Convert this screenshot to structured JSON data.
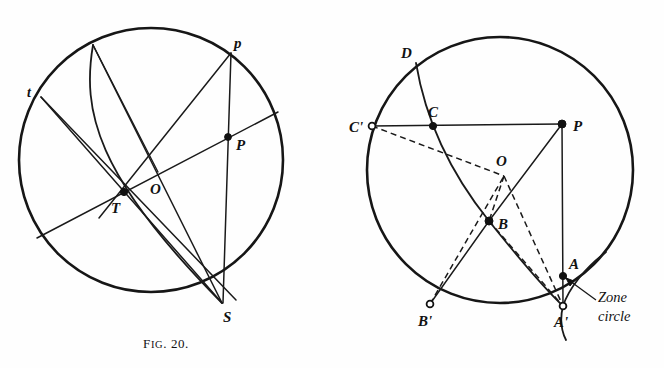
{
  "document": {
    "kind": "textbook-figure-plate",
    "figure_count": 2
  },
  "figures": [
    {
      "id": "fig-20",
      "caption_prefix": "F",
      "caption_smallcaps": "IG",
      "caption_suffix": ". 20.",
      "caption_full": "Fig. 20.",
      "circle": {
        "cx": 151,
        "cy": 160,
        "r": 132
      },
      "points": [
        {
          "name": "t",
          "label": "t",
          "x": 41,
          "y": 97,
          "marker": "none",
          "label_x": 27,
          "label_y": 92
        },
        {
          "name": "p",
          "label": "p",
          "x": 231,
          "y": 53,
          "marker": "none",
          "label_x": 236,
          "label_y": 42
        },
        {
          "name": "P",
          "label": "P",
          "x": 228,
          "y": 137,
          "marker": "filled",
          "label_x": 236,
          "label_y": 147
        },
        {
          "name": "O",
          "label": "O",
          "x": 158,
          "y": 172,
          "marker": "none",
          "label_x": 151,
          "label_y": 192
        },
        {
          "name": "T",
          "label": "T",
          "x": 124,
          "y": 192,
          "marker": "filled",
          "label_x": 113,
          "label_y": 212
        },
        {
          "name": "S",
          "label": "S",
          "x": 222,
          "y": 303,
          "marker": "none",
          "label_x": 224,
          "label_y": 321
        }
      ],
      "chords": [
        {
          "name": "chord-t-S",
          "from": "t",
          "to": "S"
        },
        {
          "name": "chord-t-O-P",
          "from": "t",
          "to": "P-ext"
        },
        {
          "name": "chord-p-S",
          "from": "p",
          "to": "S"
        },
        {
          "name": "chord-p-O-T",
          "from": "p",
          "to": "T-ext"
        },
        {
          "name": "chord-top-O-S",
          "from": "top-arc",
          "to": "S"
        },
        {
          "name": "chord-P-ray",
          "from": "O",
          "to": "P-rim"
        }
      ],
      "arcs": [
        {
          "name": "arc-top-to-S",
          "desc": "curved arc from upper rim through T to S"
        }
      ]
    },
    {
      "id": "fig-21",
      "caption_prefix": "F",
      "caption_smallcaps": "IG",
      "caption_suffix": ". 21.",
      "caption_full": "Fig. 21.",
      "circle": {
        "cx": 500,
        "cy": 170,
        "r": 133
      },
      "points": [
        {
          "name": "D",
          "label": "D",
          "x": 416,
          "y": 63,
          "marker": "none",
          "label_x": 402,
          "label_y": 54
        },
        {
          "name": "C",
          "label": "C",
          "x": 433,
          "y": 126,
          "marker": "filled",
          "label_x": 428,
          "label_y": 116
        },
        {
          "name": "C'",
          "label": "C'",
          "x": 372,
          "y": 126,
          "marker": "open",
          "label_x": 351,
          "label_y": 131
        },
        {
          "name": "P",
          "label": "P",
          "x": 562,
          "y": 124,
          "marker": "filled",
          "label_x": 572,
          "label_y": 130
        },
        {
          "name": "O",
          "label": "O",
          "x": 502,
          "y": 172,
          "marker": "none",
          "label_x": 497,
          "label_y": 165
        },
        {
          "name": "B",
          "label": "B",
          "x": 489,
          "y": 221,
          "marker": "filled",
          "label_x": 498,
          "label_y": 228
        },
        {
          "name": "B'",
          "label": "B'",
          "x": 430,
          "y": 304,
          "marker": "open",
          "label_x": 420,
          "label_y": 325
        },
        {
          "name": "A",
          "label": "A",
          "x": 563,
          "y": 276,
          "marker": "filled",
          "label_x": 569,
          "label_y": 268
        },
        {
          "name": "A'",
          "label": "A'",
          "x": 563,
          "y": 306,
          "marker": "open",
          "label_x": 556,
          "label_y": 326
        }
      ],
      "annotation": {
        "name": "zone-circle-callout",
        "line1": "Zone",
        "line2": "circle",
        "line1_x": 598,
        "line1_y": 302,
        "line2_x": 598,
        "line2_y": 321
      },
      "solid_segments": [
        {
          "name": "seg-Cprime-C-P",
          "from": "C'",
          "to": "P"
        },
        {
          "name": "seg-P-Aprime",
          "from": "P",
          "to": "A'"
        },
        {
          "name": "seg-P-B",
          "from": "P",
          "to": "B"
        },
        {
          "name": "seg-B-Bprime",
          "from": "B",
          "to": "B'"
        }
      ],
      "dashed_segments": [
        {
          "name": "dash-Cprime-O",
          "from": "C'",
          "to": "O"
        },
        {
          "name": "dash-O-B",
          "from": "O",
          "to": "B"
        },
        {
          "name": "dash-O-Aprime",
          "from": "O",
          "to": "A'"
        },
        {
          "name": "dash-B-Aprime",
          "from": "B",
          "to": "A'"
        },
        {
          "name": "dash-Bprime-O",
          "from": "B'",
          "to": "O"
        }
      ],
      "arcs": [
        {
          "name": "arc-D-C-B-Aprime",
          "desc": "great-circle arc from D through C and B down to A'"
        },
        {
          "name": "arc-zone-circle",
          "desc": "small zone circle arc passing near A and A'"
        }
      ]
    }
  ],
  "colors": {
    "ink": "#111111",
    "paper": "#fefefe"
  }
}
